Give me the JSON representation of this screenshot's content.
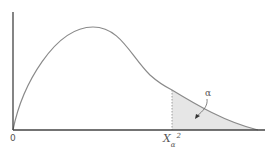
{
  "diagram": {
    "type": "chi-square-density",
    "origin_label": "0",
    "critical_value_label": "X",
    "critical_value_subscript": "α",
    "critical_value_superscript": "2",
    "tail_area_label": "α",
    "colors": {
      "axis": "#333333",
      "curve": "#8a8a8a",
      "shade": "#e6e6e6",
      "dashed": "#888888"
    }
  }
}
